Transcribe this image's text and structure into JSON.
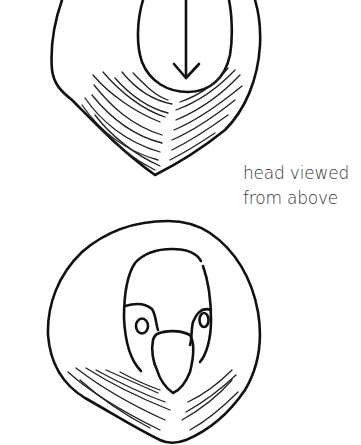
{
  "figure": {
    "caption": {
      "line1": "head viewed",
      "line2": "from above"
    },
    "sketches": [
      {
        "name": "head-top-view",
        "features": [
          "outer-head-outline",
          "crown-oval",
          "direction-arrow",
          "feather-hatching"
        ]
      },
      {
        "name": "head-front-view",
        "features": [
          "outer-head-circle",
          "face-mask",
          "left-eye",
          "right-eye",
          "beak",
          "feather-hatching"
        ]
      }
    ],
    "colors": {
      "ink": "#111111",
      "text": "#333333",
      "background": "#ffffff"
    }
  }
}
